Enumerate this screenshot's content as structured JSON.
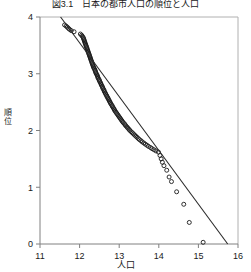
{
  "title": "図3.1　日本の都市人口の順位と人口",
  "axis": {
    "x_label": "人口",
    "y_label_chars": [
      "順",
      "位"
    ],
    "x_ticks": [
      "11",
      "12",
      "13",
      "14",
      "15",
      "16"
    ],
    "y_ticks": [
      "0",
      "1",
      "2",
      "3",
      "4"
    ]
  },
  "colors": {
    "axis": "#808080",
    "frame": "#b0b0b0",
    "marker": "#1a1a1a",
    "line": "#2a2a2a",
    "text": "#1a1a1a",
    "background": "#ffffff"
  },
  "chart_data": {
    "type": "scatter",
    "title": "図3.1　日本の都市人口の順位と人口",
    "xlabel": "人口",
    "ylabel": "順位",
    "xlim": [
      11,
      16
    ],
    "ylim": [
      0,
      4
    ],
    "grid": false,
    "legend": null,
    "marker": "open-circle",
    "series": [
      {
        "name": "都市",
        "type": "scatter",
        "points": [
          [
            11.62,
            3.86
          ],
          [
            11.66,
            3.84
          ],
          [
            11.69,
            3.82
          ],
          [
            11.72,
            3.8
          ],
          [
            11.75,
            3.78
          ],
          [
            11.79,
            3.76
          ],
          [
            11.86,
            3.74
          ],
          [
            12.02,
            3.7
          ],
          [
            12.05,
            3.68
          ],
          [
            12.07,
            3.66
          ],
          [
            12.09,
            3.64
          ],
          [
            12.1,
            3.62
          ],
          [
            12.11,
            3.6
          ],
          [
            12.12,
            3.58
          ],
          [
            12.13,
            3.56
          ],
          [
            12.14,
            3.54
          ],
          [
            12.15,
            3.52
          ],
          [
            12.16,
            3.5
          ],
          [
            12.17,
            3.48
          ],
          [
            12.18,
            3.46
          ],
          [
            12.19,
            3.44
          ],
          [
            12.2,
            3.42
          ],
          [
            12.21,
            3.4
          ],
          [
            12.22,
            3.38
          ],
          [
            12.23,
            3.36
          ],
          [
            12.24,
            3.34
          ],
          [
            12.25,
            3.32
          ],
          [
            12.26,
            3.3
          ],
          [
            12.27,
            3.28
          ],
          [
            12.28,
            3.26
          ],
          [
            12.29,
            3.24
          ],
          [
            12.3,
            3.22
          ],
          [
            12.31,
            3.2
          ],
          [
            12.32,
            3.18
          ],
          [
            12.33,
            3.16
          ],
          [
            12.34,
            3.14
          ],
          [
            12.35,
            3.12
          ],
          [
            12.36,
            3.1
          ],
          [
            12.38,
            3.08
          ],
          [
            12.39,
            3.06
          ],
          [
            12.4,
            3.04
          ],
          [
            12.41,
            3.02
          ],
          [
            12.42,
            3.0
          ],
          [
            12.44,
            2.98
          ],
          [
            12.45,
            2.96
          ],
          [
            12.46,
            2.94
          ],
          [
            12.47,
            2.92
          ],
          [
            12.49,
            2.9
          ],
          [
            12.5,
            2.88
          ],
          [
            12.51,
            2.86
          ],
          [
            12.53,
            2.84
          ],
          [
            12.54,
            2.82
          ],
          [
            12.55,
            2.8
          ],
          [
            12.57,
            2.78
          ],
          [
            12.58,
            2.76
          ],
          [
            12.59,
            2.74
          ],
          [
            12.61,
            2.72
          ],
          [
            12.62,
            2.7
          ],
          [
            12.63,
            2.68
          ],
          [
            12.65,
            2.66
          ],
          [
            12.66,
            2.64
          ],
          [
            12.68,
            2.62
          ],
          [
            12.69,
            2.6
          ],
          [
            12.71,
            2.58
          ],
          [
            12.72,
            2.56
          ],
          [
            12.74,
            2.54
          ],
          [
            12.75,
            2.52
          ],
          [
            12.77,
            2.5
          ],
          [
            12.78,
            2.48
          ],
          [
            12.8,
            2.46
          ],
          [
            12.82,
            2.44
          ],
          [
            12.83,
            2.42
          ],
          [
            12.85,
            2.4
          ],
          [
            12.87,
            2.38
          ],
          [
            12.88,
            2.36
          ],
          [
            12.9,
            2.34
          ],
          [
            12.92,
            2.32
          ],
          [
            12.94,
            2.3
          ],
          [
            12.96,
            2.28
          ],
          [
            12.98,
            2.26
          ],
          [
            13.0,
            2.24
          ],
          [
            13.02,
            2.22
          ],
          [
            13.04,
            2.2
          ],
          [
            13.06,
            2.18
          ],
          [
            13.08,
            2.16
          ],
          [
            13.1,
            2.14
          ],
          [
            13.13,
            2.12
          ],
          [
            13.15,
            2.1
          ],
          [
            13.17,
            2.08
          ],
          [
            13.2,
            2.06
          ],
          [
            13.22,
            2.04
          ],
          [
            13.25,
            2.02
          ],
          [
            13.27,
            2.0
          ],
          [
            13.3,
            1.98
          ],
          [
            13.33,
            1.96
          ],
          [
            13.36,
            1.94
          ],
          [
            13.39,
            1.92
          ],
          [
            13.42,
            1.9
          ],
          [
            13.45,
            1.88
          ],
          [
            13.48,
            1.86
          ],
          [
            13.51,
            1.84
          ],
          [
            13.55,
            1.82
          ],
          [
            13.58,
            1.8
          ],
          [
            13.62,
            1.78
          ],
          [
            13.66,
            1.76
          ],
          [
            13.7,
            1.74
          ],
          [
            13.74,
            1.72
          ],
          [
            13.79,
            1.7
          ],
          [
            13.83,
            1.68
          ],
          [
            13.88,
            1.66
          ],
          [
            13.93,
            1.64
          ],
          [
            13.99,
            1.62
          ],
          [
            14.03,
            1.56
          ],
          [
            14.06,
            1.5
          ],
          [
            14.09,
            1.44
          ],
          [
            14.13,
            1.38
          ],
          [
            14.2,
            1.3
          ],
          [
            14.26,
            1.18
          ],
          [
            14.32,
            1.1
          ],
          [
            14.45,
            0.92
          ],
          [
            14.63,
            0.7
          ],
          [
            14.77,
            0.38
          ],
          [
            15.12,
            0.03
          ]
        ]
      },
      {
        "name": "回帰直線",
        "type": "line",
        "points": [
          [
            11.52,
            4.0
          ],
          [
            15.74,
            0.0
          ]
        ],
        "slope": -0.948,
        "description": "最小二乗回帰直線"
      }
    ]
  }
}
